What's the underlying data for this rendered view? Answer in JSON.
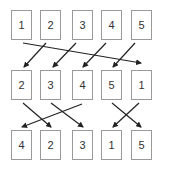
{
  "diagram": {
    "rows": [
      {
        "id": "row1",
        "y": 10,
        "items": [
          "1",
          "2",
          "3",
          "4",
          "5"
        ]
      },
      {
        "id": "row2",
        "y": 70,
        "items": [
          "2",
          "3",
          "4",
          "5",
          "1"
        ]
      },
      {
        "id": "row3",
        "y": 130,
        "items": [
          "4",
          "2",
          "3",
          "1",
          "5"
        ]
      }
    ],
    "column_x": [
      11,
      40,
      72,
      101,
      131
    ],
    "arrows_row1_to_row2": [
      {
        "from": 0,
        "to": 4
      },
      {
        "from": 1,
        "to": 0
      },
      {
        "from": 2,
        "to": 1
      },
      {
        "from": 3,
        "to": 2
      },
      {
        "from": 4,
        "to": 3
      }
    ],
    "arrows_row2_to_row3": [
      {
        "from": 0,
        "to": 1
      },
      {
        "from": 1,
        "to": 2
      },
      {
        "from": 2,
        "to": 0
      },
      {
        "from": 3,
        "to": 4
      },
      {
        "from": 4,
        "to": 3
      }
    ],
    "colors": {
      "border": "#9a9a9a",
      "arrow": "#222222",
      "text": "#333333"
    }
  }
}
